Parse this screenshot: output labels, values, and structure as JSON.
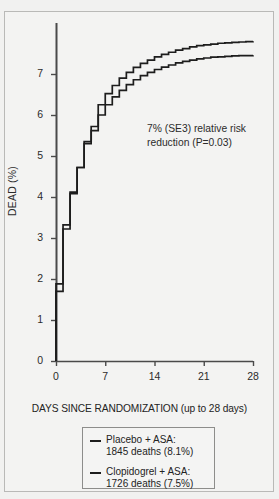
{
  "chart_data": {
    "type": "line",
    "title": "",
    "subtitle": "",
    "xlabel": "DAYS SINCE RANDOMIZATION (up to 28 days)",
    "ylabel": "DEAD (%)",
    "xlim": [
      0,
      28
    ],
    "ylim": [
      0,
      7.9
    ],
    "xticks": [
      0,
      7,
      14,
      21,
      28
    ],
    "xtick_labels": [
      "0",
      "7",
      "14",
      "21",
      "28"
    ],
    "yticks": [
      0,
      1,
      2,
      3,
      4,
      5,
      6,
      7
    ],
    "ytick_labels": [
      "0",
      "1",
      "2",
      "3",
      "4",
      "5",
      "6",
      "7"
    ],
    "grid": false,
    "legend_position": "bottom-center",
    "annotations": [
      "7% (SE3) relative risk",
      "reduction (P=0.03)"
    ],
    "annotation_text": "7% (SE3) relative risk reduction (P=0.03)",
    "line_color": "#1d1d1d",
    "x": [
      0,
      1,
      2,
      3,
      4,
      5,
      6,
      7,
      8,
      9,
      10,
      11,
      12,
      13,
      14,
      15,
      16,
      17,
      18,
      19,
      20,
      21,
      22,
      23,
      24,
      25,
      26,
      27,
      28
    ],
    "series": [
      {
        "name": "Placebo + ASA",
        "deaths": 1845,
        "percent": "8.1%",
        "legend_line1": "Placebo + ASA:",
        "legend_line2": "1845 deaths (8.1%)",
        "values": [
          1.88,
          3.32,
          4.12,
          4.72,
          5.35,
          5.72,
          6.25,
          6.52,
          6.72,
          6.9,
          7.04,
          7.16,
          7.26,
          7.34,
          7.42,
          7.48,
          7.53,
          7.58,
          7.62,
          7.66,
          7.69,
          7.71,
          7.73,
          7.75,
          7.76,
          7.77,
          7.78,
          7.79,
          7.8
        ]
      },
      {
        "name": "Clopidogrel + ASA",
        "deaths": 1726,
        "percent": "7.5%",
        "legend_line1": "Clopidogrel + ASA:",
        "legend_line2": "1726 deaths (7.5%)",
        "values": [
          1.7,
          3.22,
          4.08,
          4.72,
          5.3,
          5.62,
          6.0,
          6.25,
          6.44,
          6.6,
          6.74,
          6.86,
          6.96,
          7.04,
          7.11,
          7.17,
          7.22,
          7.27,
          7.31,
          7.34,
          7.37,
          7.39,
          7.41,
          7.42,
          7.43,
          7.44,
          7.45,
          7.45,
          7.46
        ]
      }
    ]
  },
  "legend": {
    "entries": [
      {
        "line1": "Placebo + ASA:",
        "line2": "1845 deaths (8.1%)"
      },
      {
        "line1": "Clopidogrel + ASA:",
        "line2": "1726 deaths (7.5%)"
      }
    ]
  },
  "annotation": {
    "line1": "7% (SE3) relative risk",
    "line2": "reduction (P=0.03)"
  },
  "axes": {
    "y_title": "DEAD (%)",
    "x_title": "DAYS SINCE RANDOMIZATION (up to 28 days)"
  }
}
